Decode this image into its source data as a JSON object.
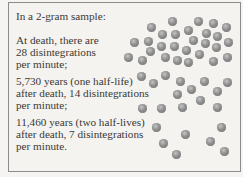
{
  "figure": {
    "intro": "In a 2-gram sample:",
    "stages": [
      {
        "lines": [
          "At death, there are",
          "28 disintegrations",
          "per minute;"
        ]
      },
      {
        "lines": [
          "5,730 years (one half-life)",
          "after death, 14 disintegrations",
          "per minute;"
        ]
      },
      {
        "lines": [
          "11,460 years (two half-lives)",
          "after death, 7 disintegrations",
          "per minute."
        ]
      }
    ],
    "dot_color": "#8f8f8f",
    "dots": [
      [
        172,
        21
      ],
      [
        151,
        27
      ],
      [
        162,
        34
      ],
      [
        175,
        34
      ],
      [
        134,
        42
      ],
      [
        148,
        41
      ],
      [
        161,
        46
      ],
      [
        174,
        46
      ],
      [
        150,
        51
      ],
      [
        128,
        57
      ],
      [
        142,
        60
      ],
      [
        165,
        57
      ],
      [
        177,
        60
      ],
      [
        198,
        21
      ],
      [
        213,
        23
      ],
      [
        226,
        27
      ],
      [
        188,
        30
      ],
      [
        206,
        33
      ],
      [
        217,
        36
      ],
      [
        193,
        40
      ],
      [
        205,
        43
      ],
      [
        228,
        42
      ],
      [
        216,
        47
      ],
      [
        186,
        50
      ],
      [
        199,
        54
      ],
      [
        227,
        57
      ],
      [
        188,
        62
      ],
      [
        213,
        61
      ],
      [
        141,
        76
      ],
      [
        153,
        83
      ],
      [
        165,
        75
      ],
      [
        180,
        81
      ],
      [
        204,
        81
      ],
      [
        227,
        82
      ],
      [
        191,
        89
      ],
      [
        177,
        94
      ],
      [
        217,
        91
      ],
      [
        200,
        100
      ],
      [
        142,
        108
      ],
      [
        161,
        108
      ],
      [
        182,
        107
      ],
      [
        217,
        107
      ],
      [
        156,
        127
      ],
      [
        221,
        127
      ],
      [
        185,
        134
      ],
      [
        163,
        143
      ],
      [
        210,
        141
      ],
      [
        176,
        154
      ],
      [
        224,
        151
      ]
    ]
  }
}
